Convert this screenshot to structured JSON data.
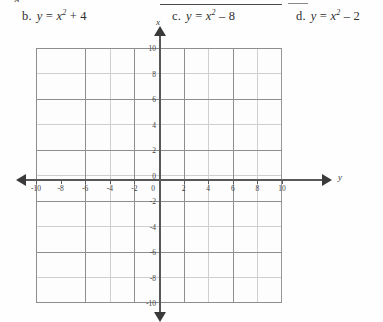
{
  "worksheet": {
    "clipped_fragment": "a.",
    "choices": [
      {
        "id": "b",
        "label": "b.",
        "lhs": "y",
        "equals": "=",
        "base": "x",
        "exponent": "2",
        "operator": "+",
        "constant": "4",
        "text": "b.  y = x² + 4"
      },
      {
        "id": "c",
        "label": "c.",
        "lhs": "y",
        "equals": "=",
        "base": "x",
        "exponent": "2",
        "operator": "–",
        "constant": "8",
        "text": "c.  y = x² – 8"
      },
      {
        "id": "d",
        "label": "d.",
        "lhs": "y",
        "equals": "=",
        "base": "x",
        "exponent": "2",
        "operator": "–",
        "constant": "2",
        "text": "d.  y = x² – 2"
      }
    ]
  },
  "chart_data": {
    "type": "scatter",
    "title": "",
    "xlabel": "y",
    "ylabel": "x",
    "vertical_axis_label": "x",
    "horizontal_axis_label": "y",
    "xlim": [
      -10,
      10
    ],
    "ylim": [
      -10,
      10
    ],
    "grid": true,
    "grid_minor_step": 1,
    "grid_major_step": 2,
    "legend": "none",
    "series": [],
    "values": [],
    "x": [],
    "horizontal_ticks": [
      "-10",
      "-8",
      "-6",
      "-4",
      "-2",
      "0",
      "2",
      "4",
      "6",
      "8",
      "10"
    ],
    "vertical_ticks": [
      "10",
      "8",
      "6",
      "4",
      "2",
      "0",
      "-2",
      "-4",
      "-6",
      "-8",
      "-10"
    ],
    "origin_label": "0",
    "arrows": {
      "up": "arrow-up-icon",
      "down": "arrow-down-icon",
      "left": "arrow-left-icon",
      "right": "arrow-right-icon"
    }
  }
}
